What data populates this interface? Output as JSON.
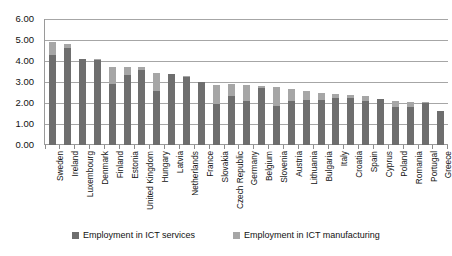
{
  "chart_data": {
    "type": "bar",
    "stacked": true,
    "title": "",
    "xlabel": "",
    "ylabel": "",
    "ylim": [
      0,
      6
    ],
    "ytick_labels": [
      "0.00",
      "1.00",
      "2.00",
      "3.00",
      "4.00",
      "5.00",
      "6.00"
    ],
    "ytick_values": [
      0,
      1,
      2,
      3,
      4,
      5,
      6
    ],
    "grid": true,
    "legend_position": "bottom",
    "categories": [
      "Sweden",
      "Ireland",
      "Luxembourg",
      "Denmark",
      "Finland",
      "Estonia",
      "United Kingdom",
      "Hungary",
      "Latvia",
      "Netherlands",
      "France",
      "Slovakia",
      "Czech Republic",
      "Germany",
      "Belgium",
      "Slovenia",
      "Austria",
      "Lithuania",
      "Bulgaria",
      "Italy",
      "Croatia",
      "Spain",
      "Cyprus",
      "Poland",
      "Romania",
      "Portugal",
      "Greece"
    ],
    "series": [
      {
        "name": "Employment in ICT services",
        "color": "#6e6e6e",
        "values": [
          4.3,
          4.6,
          4.1,
          4.05,
          2.9,
          3.35,
          3.55,
          2.55,
          3.4,
          3.25,
          3.0,
          1.95,
          2.35,
          2.1,
          2.7,
          1.85,
          2.1,
          2.15,
          2.15,
          2.25,
          2.25,
          2.1,
          2.2,
          1.8,
          1.8,
          2.0,
          1.6
        ]
      },
      {
        "name": "Employment in ICT manufacturing",
        "color": "#a6a6a6",
        "values": [
          0.6,
          0.2,
          0.0,
          0.05,
          0.8,
          0.35,
          0.15,
          0.9,
          0.0,
          0.05,
          0.0,
          0.9,
          0.55,
          0.75,
          0.1,
          0.9,
          0.55,
          0.4,
          0.35,
          0.2,
          0.15,
          0.25,
          0.0,
          0.3,
          0.25,
          0.05,
          0.0
        ]
      }
    ],
    "totals": [
      4.9,
      4.8,
      4.1,
      4.1,
      3.7,
      3.7,
      3.7,
      3.45,
      3.4,
      3.3,
      3.0,
      2.85,
      2.9,
      2.85,
      2.8,
      2.75,
      2.65,
      2.55,
      2.5,
      2.45,
      2.4,
      2.35,
      2.2,
      2.1,
      2.05,
      2.05,
      1.6
    ]
  },
  "legend": {
    "items": [
      {
        "label": "Employment in ICT services"
      },
      {
        "label": "Employment in ICT manufacturing"
      }
    ]
  }
}
